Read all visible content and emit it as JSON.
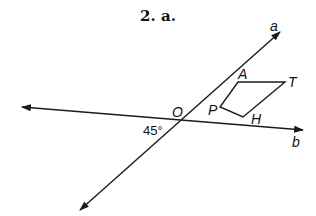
{
  "title": "2. a.",
  "lines": {
    "a": {
      "label": "a",
      "from": [
        80,
        210
      ],
      "to": [
        280,
        32
      ]
    },
    "b": {
      "label": "b",
      "from": [
        22,
        107
      ],
      "to": [
        303,
        130
      ]
    }
  },
  "intersection": {
    "label": "O",
    "point": [
      182,
      120
    ]
  },
  "angle": {
    "label": "45°"
  },
  "quadrilateral": {
    "vertices": [
      {
        "label": "A",
        "point": [
          238,
          82
        ]
      },
      {
        "label": "T",
        "point": [
          285,
          82
        ]
      },
      {
        "label": "H",
        "point": [
          243,
          117
        ]
      },
      {
        "label": "P",
        "point": [
          220,
          107
        ]
      }
    ]
  },
  "colors": {
    "stroke": "#1a1a1a",
    "text": "#111111",
    "background": "#ffffff"
  }
}
